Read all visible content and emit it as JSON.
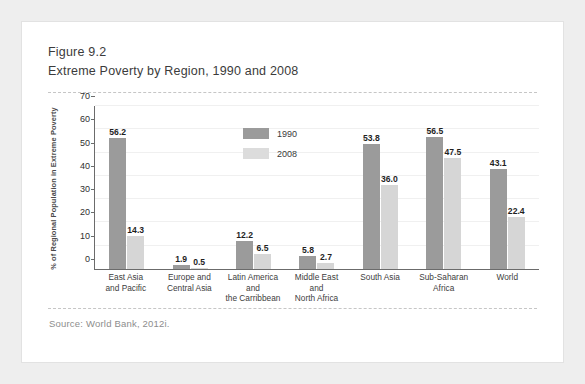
{
  "figure": {
    "number": "Figure 9.2",
    "title": "Extreme Poverty by Region, 1990 and 2008",
    "source": "Source: World Bank, 2012i."
  },
  "colors": {
    "series_1990": "#9b9b9b",
    "series_2008": "#d6d6d6",
    "axis": "#6b6b6b",
    "card_background": "#ffffff",
    "page_background": "#eeeeee"
  },
  "chart_data": {
    "type": "bar",
    "title": "Extreme Poverty by Region, 1990 and 2008",
    "xlabel": "",
    "ylabel": "% of Regional Population in Extreme Poverty",
    "ylim": [
      0,
      70
    ],
    "yticks": [
      0,
      10,
      20,
      30,
      40,
      50,
      60,
      70
    ],
    "grid": true,
    "legend_position": "top-center",
    "categories": [
      "East Asia and Pacific",
      "Europe and Central Asia",
      "Latin America and the Carribbean",
      "Middle East and North Africa",
      "South Asia",
      "Sub-Saharan Africa",
      "World"
    ],
    "category_lines": [
      [
        "East Asia",
        "and Pacific"
      ],
      [
        "Europe and",
        "Central Asia"
      ],
      [
        "Latin America",
        "and",
        "the Carribbean"
      ],
      [
        "Middle East",
        "and",
        "North Africa"
      ],
      [
        "South Asia"
      ],
      [
        "Sub-Saharan",
        "Africa"
      ],
      [
        "World"
      ]
    ],
    "series": [
      {
        "name": "1990",
        "values": [
          56.2,
          1.9,
          12.2,
          5.8,
          53.8,
          56.5,
          43.1
        ]
      },
      {
        "name": "2008",
        "values": [
          14.3,
          0.5,
          6.5,
          2.7,
          36.0,
          47.5,
          22.4
        ]
      }
    ],
    "value_labels": [
      [
        "56.2",
        "14.3"
      ],
      [
        "1.9",
        "0.5"
      ],
      [
        "12.2",
        "6.5"
      ],
      [
        "5.8",
        "2.7"
      ],
      [
        "53.8",
        "36.0"
      ],
      [
        "56.5",
        "47.5"
      ],
      [
        "43.1",
        "22.4"
      ]
    ]
  }
}
